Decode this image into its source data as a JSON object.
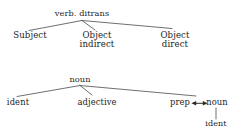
{
  "figure": {
    "kind": "syntax-tree-diagram",
    "ink_color": "#242424",
    "line_color": "#555555",
    "background_color": "#ffffff"
  },
  "tree_ditransitive": {
    "root": {
      "label": "verb. ditrans"
    },
    "children": [
      {
        "label": "Subject"
      },
      {
        "label_line1": "Object",
        "label_line2": "indirect"
      },
      {
        "label_line1": "Object",
        "label_line2": "direct"
      }
    ]
  },
  "tree_noun_phrase": {
    "root": {
      "label": "noun"
    },
    "children": [
      {
        "label": "ident"
      },
      {
        "label": "adjective"
      },
      {
        "label": "prep"
      }
    ],
    "linked_node": {
      "label": "noun"
    },
    "linked_child": {
      "label": "ident"
    },
    "connector": {
      "glyph": "double-headed-arrow"
    }
  }
}
